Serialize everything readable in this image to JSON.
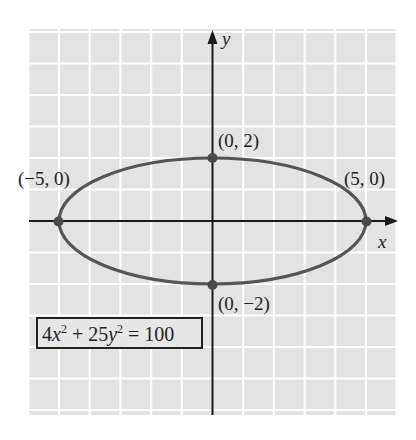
{
  "chart_data": {
    "type": "line",
    "title": "",
    "xlabel": "x",
    "ylabel": "y",
    "equation": "4x^2 + 25y^2 = 100",
    "curve": "ellipse",
    "center": [
      0,
      0
    ],
    "semi_major_a": 5,
    "semi_minor_b": 2,
    "xlim": [
      -6,
      6
    ],
    "ylim": [
      -6.5,
      6
    ],
    "grid": true,
    "grid_step": 1,
    "points": [
      {
        "x": -5,
        "y": 0,
        "label": "(−5, 0)"
      },
      {
        "x": 5,
        "y": 0,
        "label": "(5, 0)"
      },
      {
        "x": 0,
        "y": 2,
        "label": "(0, 2)"
      },
      {
        "x": 0,
        "y": -2,
        "label": "(0, −2)"
      }
    ],
    "colors": {
      "background": "#e3e3e3",
      "grid": "#ffffff",
      "curve": "#555555",
      "axes": "#1a1a1a"
    }
  },
  "labels": {
    "x_axis": "x",
    "y_axis": "y",
    "p_left": "(−5, 0)",
    "p_right": "(5, 0)",
    "p_top": "(0, 2)",
    "p_bottom": "(0, −2)",
    "eq_coef1": "4",
    "eq_var1": "x",
    "eq_exp1": "2",
    "eq_plus": " + 25",
    "eq_var2": "y",
    "eq_exp2": "2",
    "eq_rhs": " = 100"
  }
}
